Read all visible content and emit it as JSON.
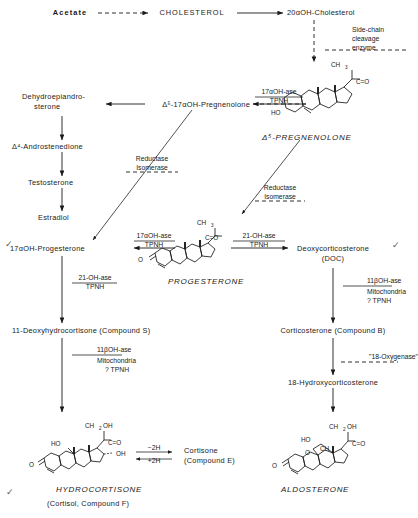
{
  "nodes": {
    "acetate": "Acetate",
    "cholesterol": "CHOLESTEROL",
    "hydroxycholesterol": "20αOH-Cholesterol",
    "pregnenolone_label": "Δ⁵-PREGNENOLONE",
    "oh_pregnenolone": "Δ⁵-17αOH-Pregnenolone",
    "dhea_line1": "Dehydroepiandro-",
    "dhea_line2": "sterone",
    "androstenedione": "Δ⁴-Androstenedione",
    "testosterone": "Testosterone",
    "estradiol": "Estradiol",
    "oh_progesterone": "17αOH-Progesterone",
    "progesterone_label": "PROGESTERONE",
    "doc_line1": "Deoxycorticosterone",
    "doc_line2": "(DOC)",
    "compound_s": "11-Deoxyhydrocortisone  (Compound S)",
    "corticosterone": "Corticosterone (Compound B)",
    "hydroxycorticosterone": "18-Hydroxycorticosterone",
    "hydrocortisone_label": "HYDROCORTISONE",
    "hydrocortisone_sub": "(Cortisol, Compound F)",
    "aldosterone_label": "ALDOSTERONE",
    "cortisone_line1": "Cortisone",
    "cortisone_line2": "(Compound E)"
  },
  "enzymes": {
    "side_chain": [
      "Side-chain",
      "cleavage",
      "enzyme"
    ],
    "seventeen_oh_ase_top": [
      "17αOH-ase",
      "TPNH"
    ],
    "reductase_isomerase_left": [
      "Reductase",
      "Isomerase"
    ],
    "reductase_isomerase_right": [
      "Reductase",
      "Isomerase"
    ],
    "seventeen_oh_ase_mid": [
      "17αOH-ase",
      "TPNH"
    ],
    "twentyone_oh_ase_right": [
      "21-OH-ase",
      "TPNH"
    ],
    "twentyone_oh_ase_left": [
      "21-OH-ase",
      "TPNH"
    ],
    "eleven_beta_left": [
      "11βOH-ase",
      "Mitochondria",
      "? TPNH"
    ],
    "eleven_beta_right": [
      "11βOH-ase",
      "Mitochondria",
      "? TPNH"
    ],
    "oxygenase": "\"18-Oxygenase\"",
    "minus_2h": "−2H",
    "plus_2h": "+2H"
  },
  "structures": {
    "pregnenolone": {
      "ch3": "CH",
      "ch3_sub": "3",
      "co": "C=O",
      "ho": "HO"
    },
    "progesterone": {
      "ch3": "CH",
      "ch3_sub": "3",
      "co": "C=O",
      "o": "O"
    },
    "hydrocortisone": {
      "ch2oh": "CH",
      "ch2oh_sub": "2",
      "ch2oh_tail": "OH",
      "co": "C=O",
      "oh_side": "OH",
      "ho": "HO",
      "o": "O"
    },
    "aldosterone": {
      "ch2oh": "CH",
      "ch2oh_sub": "2",
      "ch2oh_tail": "OH",
      "co": "C=O",
      "ho": "HO",
      "ch": "CH",
      "o_ring": "O",
      "o": "O"
    }
  },
  "marks": {
    "check": "✓"
  },
  "colors": {
    "ink": "#1a1a1a",
    "paper": "#ffffff",
    "check": "#5a5a5a"
  }
}
